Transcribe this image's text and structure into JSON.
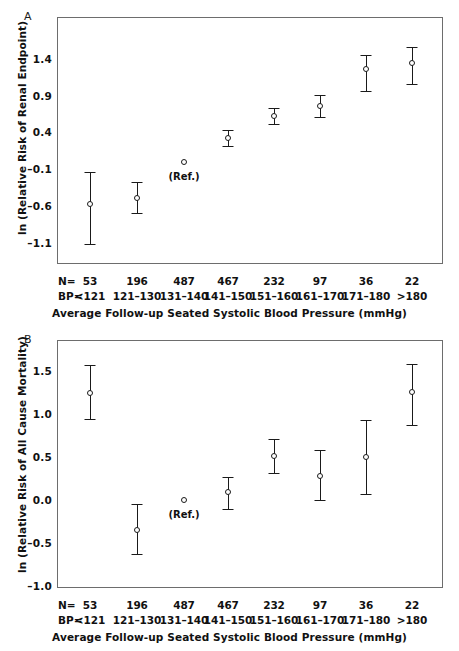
{
  "figure": {
    "panels": [
      {
        "letter": "A",
        "ylabel": "ln (Relative Risk of Renal Endpoint)",
        "xlabel": "Average Follow-up Seated Systolic Blood Pressure (mmHg)",
        "ref_note": "(Ref.)",
        "row_headers": [
          "N=",
          "BP="
        ]
      },
      {
        "letter": "B",
        "ylabel": "ln (Relative Risk of All Cause Mortality)",
        "xlabel": "Average Follow-up Seated Systolic Blood Pressure (mmHg)",
        "ref_note": "(Ref.)",
        "row_headers": [
          "N=",
          "BP="
        ]
      }
    ]
  },
  "chart_data": [
    {
      "type": "scatter",
      "panel": "A",
      "title": "",
      "xlabel": "Average Follow-up Seated Systolic Blood Pressure (mmHg)",
      "ylabel": "ln (Relative Risk of Renal Endpoint)",
      "categories": [
        "<121",
        "121–130",
        "131–140",
        "141–150",
        "151–160",
        "161–170",
        "171–180",
        ">180"
      ],
      "n_counts": [
        53,
        196,
        487,
        467,
        232,
        97,
        36,
        22
      ],
      "yticks": [
        1.4,
        0.9,
        0.4,
        -0.1,
        -0.6,
        -1.1
      ],
      "ytick_labels": [
        "1.4",
        "0.9",
        "0.4",
        "–0.1",
        "–0.6",
        "–1.1"
      ],
      "ylim": [
        -1.35,
        1.73
      ],
      "grid": false,
      "legend": "none",
      "reference_index": 2,
      "values": [
        -0.58,
        -0.5,
        0.0,
        0.33,
        0.63,
        0.76,
        1.27,
        1.34
      ],
      "ci_upper": [
        -0.14,
        -0.27,
        null,
        0.43,
        0.73,
        0.91,
        1.46,
        1.57
      ],
      "ci_lower": [
        -1.12,
        -0.7,
        null,
        0.22,
        0.52,
        0.61,
        0.96,
        1.06
      ]
    },
    {
      "type": "scatter",
      "panel": "B",
      "title": "",
      "xlabel": "Average Follow-up Seated Systolic Blood Pressure (mmHg)",
      "ylabel": "ln (Relative Risk of All Cause Mortality)",
      "categories": [
        "<121",
        "121–130",
        "131–140",
        "141–150",
        "151–160",
        "161–170",
        "171–180",
        ">180"
      ],
      "n_counts": [
        53,
        196,
        487,
        467,
        232,
        97,
        36,
        22
      ],
      "yticks": [
        1.5,
        1.0,
        0.5,
        0.0,
        -0.5,
        -1.0
      ],
      "ytick_labels": [
        "1.5",
        "1.0",
        "0.5",
        "0.0",
        "–0.5",
        "–1.0"
      ],
      "ylim": [
        -1.1,
        1.8
      ],
      "grid": false,
      "legend": "none",
      "reference_index": 2,
      "values": [
        1.24,
        -0.35,
        0.0,
        0.09,
        0.51,
        0.28,
        0.5,
        1.26
      ],
      "ci_upper": [
        1.57,
        -0.05,
        null,
        0.27,
        0.71,
        0.58,
        0.93,
        1.58
      ],
      "ci_lower": [
        0.94,
        -0.63,
        null,
        -0.1,
        0.31,
        0.0,
        0.07,
        0.87
      ]
    }
  ]
}
